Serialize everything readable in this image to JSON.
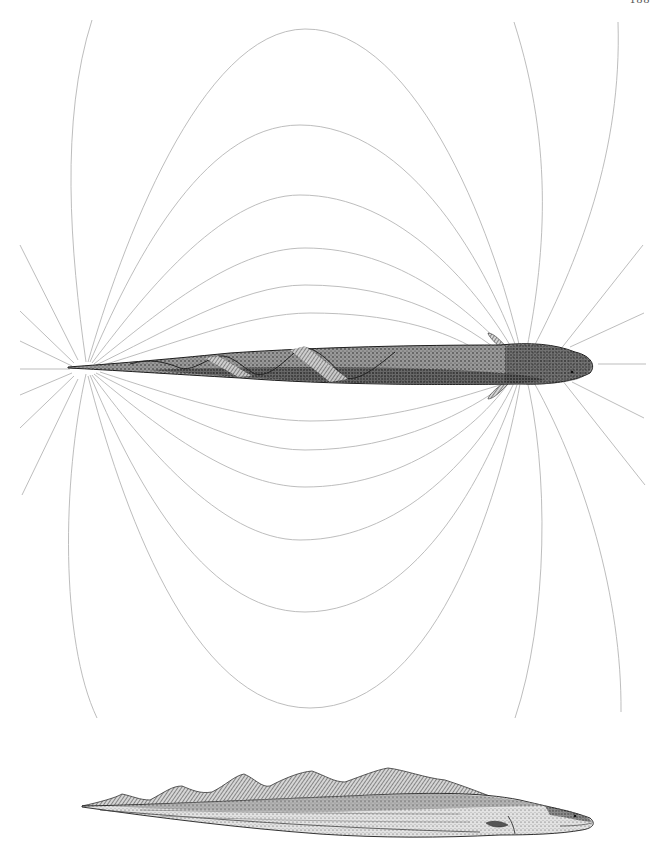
{
  "page": {
    "number": "188"
  },
  "figure": {
    "upper_specimen": "electric-eel-dorsal-view-with-field-lines",
    "lower_specimen": "electric-eel-lateral-view",
    "field_line_color": "#b5b5b5",
    "ink_color": "#1e1e1e"
  },
  "field": {
    "negative_pole": {
      "x": 85,
      "y": 368
    },
    "positive_pole": {
      "x": 523,
      "y": 365
    },
    "upper_loop_apexes": [
      29,
      125,
      195,
      248,
      285,
      313
    ],
    "lower_loop_apexes": [
      421,
      450,
      487,
      540,
      612,
      708
    ]
  }
}
